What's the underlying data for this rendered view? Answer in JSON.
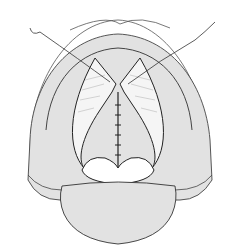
{
  "figure": {
    "colors": {
      "background": "#ffffff",
      "tissue": "#e2e2e2",
      "line": "#333333",
      "hatch": "#888888"
    }
  }
}
